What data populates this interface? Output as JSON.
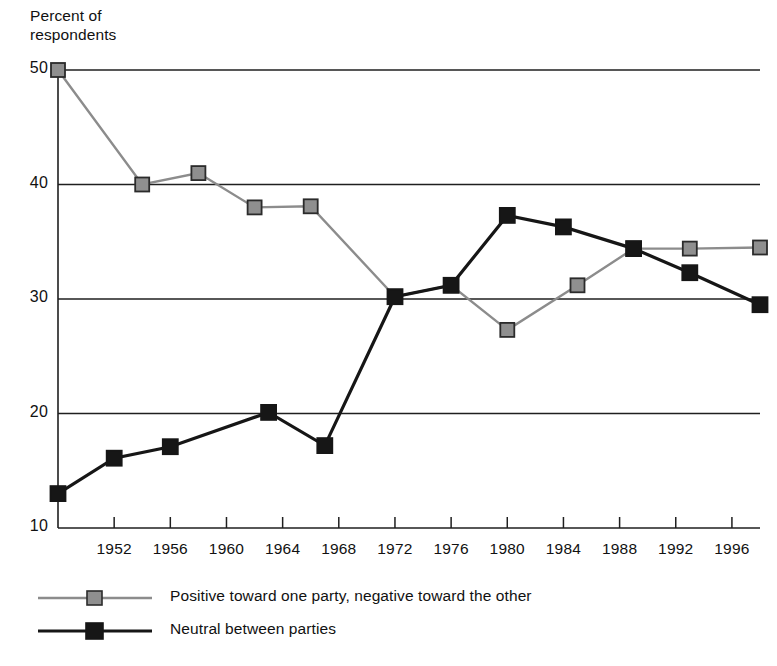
{
  "chart_data": {
    "type": "line",
    "xlabel": "",
    "ylabel": "Percent of respondents",
    "xlim": [
      1948,
      1998
    ],
    "ylim": [
      10,
      50
    ],
    "yticks": [
      10,
      20,
      30,
      40,
      50
    ],
    "xticks": [
      1952,
      1956,
      1960,
      1964,
      1968,
      1972,
      1976,
      1980,
      1984,
      1988,
      1992,
      1996
    ],
    "grid": "horizontal",
    "legend_position": "bottom-left",
    "series": [
      {
        "name": "Positive toward one party, negative toward the other",
        "color": "#8c8c8c",
        "marker_color": "#8f8f8f",
        "marker": "square",
        "x": [
          1948,
          1954,
          1958,
          1962,
          1966,
          1972,
          1976,
          1980,
          1985,
          1989,
          1993,
          1998
        ],
        "values": [
          50.0,
          40.0,
          41.0,
          38.0,
          38.1,
          30.2,
          31.2,
          27.3,
          31.2,
          34.4,
          34.4,
          34.5
        ]
      },
      {
        "name": "Neutral between parties",
        "color": "#161616",
        "marker_color": "#161616",
        "marker": "square",
        "x": [
          1948,
          1952,
          1956,
          1963,
          1967,
          1972,
          1976,
          1980,
          1984,
          1989,
          1993,
          1998
        ],
        "values": [
          13.0,
          16.1,
          17.1,
          20.1,
          17.2,
          30.2,
          31.2,
          37.3,
          36.3,
          34.4,
          32.3,
          29.5
        ]
      }
    ]
  },
  "axis": {
    "title_line1": "Percent of",
    "title_line2": "respondents",
    "ytick_labels": [
      "50",
      "40",
      "30",
      "20",
      "10"
    ],
    "xtick_labels": [
      "1952",
      "1956",
      "1960",
      "1964",
      "1968",
      "1972",
      "1976",
      "1980",
      "1984",
      "1988",
      "1992",
      "1996"
    ]
  },
  "legend": {
    "items": [
      {
        "label": "Positive toward one party, negative toward the other",
        "color": "#8c8c8c"
      },
      {
        "label": "Neutral between parties",
        "color": "#161616"
      }
    ]
  }
}
